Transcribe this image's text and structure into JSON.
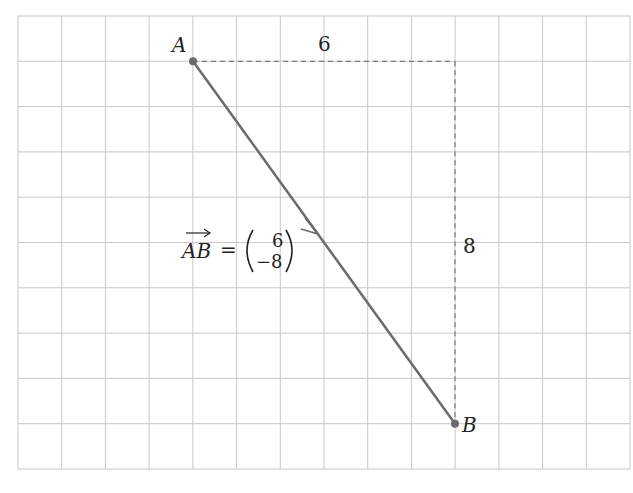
{
  "diagram": {
    "type": "vector-on-grid",
    "grid": {
      "columns": 14,
      "rows": 10,
      "line_color": "#c8c8c8"
    },
    "points": [
      {
        "name": "A",
        "grid_x": 4,
        "grid_y": 1
      },
      {
        "name": "B",
        "grid_x": 10,
        "grid_y": 9
      }
    ],
    "labels": {
      "point_a": "A",
      "point_b": "B",
      "horizontal_distance": "6",
      "vertical_distance": "8",
      "vector_name": "AB",
      "equals": "=",
      "component_x": "6",
      "component_y": "−8"
    },
    "colors": {
      "vector": "#6b6b6b",
      "dashed": "#7a7a7a",
      "text": "#222222"
    }
  }
}
